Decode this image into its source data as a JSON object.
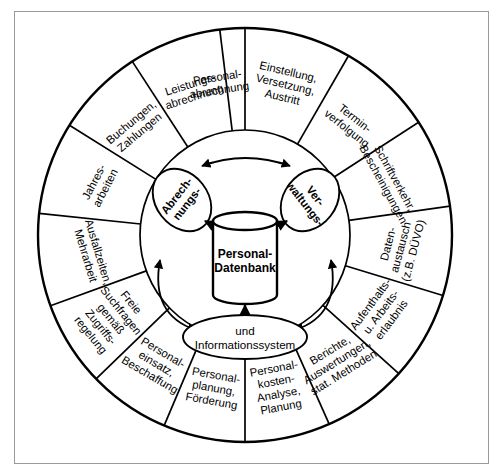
{
  "diagram": {
    "type": "hub-and-spoke-wheel",
    "geometry": {
      "center_x": 245,
      "center_y": 235,
      "outer_radius": 207,
      "inner_radius": 105,
      "top_divider_angle_deg": -90
    },
    "core": {
      "database_label_line1": "Personal-",
      "database_label_line2": "Datenbank",
      "left_lobe_line1": "Abrech-",
      "left_lobe_line2": "nungs-",
      "right_lobe_line1": "Ver-",
      "right_lobe_line2": "waltungs-",
      "bottom_ellipse_line1": "und",
      "bottom_ellipse_line2": "Informationssystem"
    },
    "segments": [
      {
        "id": "einstellung-versetzung-austritt",
        "lines": [
          "Einstellung,",
          "Versetzung,",
          "Austritt"
        ],
        "start_deg": -90,
        "end_deg": -60
      },
      {
        "id": "termin-verfolgung",
        "lines": [
          "Termin-",
          "verfolgung"
        ],
        "start_deg": -60,
        "end_deg": -33
      },
      {
        "id": "schriftverkehr-bescheinigungen",
        "lines": [
          "Schriftverkehr,",
          "Bescheinigungen"
        ],
        "start_deg": -33,
        "end_deg": -8
      },
      {
        "id": "datenaustausch-duevo",
        "lines": [
          "Daten-",
          "austausch",
          "(z.B. DÜVO)"
        ],
        "start_deg": -8,
        "end_deg": 17
      },
      {
        "id": "aufenthalts-arbeitserlaubnis",
        "lines": [
          "Aufenthalts-",
          "u. Arbeits-",
          "erlaubnis"
        ],
        "start_deg": 17,
        "end_deg": 42
      },
      {
        "id": "berichte-auswertungen",
        "lines": [
          "Berichte,",
          "Auswertungen,",
          "stat. Methoden"
        ],
        "start_deg": 42,
        "end_deg": 66
      },
      {
        "id": "personalkosten-analyse-planung",
        "lines": [
          "Personal-",
          "kosten-",
          "Analyse,",
          "Planung"
        ],
        "start_deg": 66,
        "end_deg": 90
      },
      {
        "id": "personalplanung-foerderung",
        "lines": [
          "Personal-",
          "planung,",
          "Förderung"
        ],
        "start_deg": 90,
        "end_deg": 113
      },
      {
        "id": "personaleinsatz-beschaffung",
        "lines": [
          "Personal-",
          "einsatz,",
          "Beschaffung"
        ],
        "start_deg": 113,
        "end_deg": 136
      },
      {
        "id": "freie-suchfragen-zugriffsregelung",
        "lines": [
          "Freie",
          "Suchfragen",
          "gemäß",
          "Zugriffs-",
          "regelung"
        ],
        "start_deg": 136,
        "end_deg": 160
      },
      {
        "id": "ausfallzeiten-mehrarbeit",
        "lines": [
          "Ausfallzeiten,",
          "Mehrarbeit"
        ],
        "start_deg": 160,
        "end_deg": 186
      },
      {
        "id": "jahresarbeiten",
        "lines": [
          "Jahres-",
          "arbeiten"
        ],
        "start_deg": 186,
        "end_deg": 212
      },
      {
        "id": "buchungen-zahlungen",
        "lines": [
          "Buchungen,",
          "Zahlungen"
        ],
        "start_deg": 212,
        "end_deg": 237
      },
      {
        "id": "leistungsabrechnung",
        "lines": [
          "Leistungs-",
          "abrechnung"
        ],
        "start_deg": 237,
        "end_deg": 263
      },
      {
        "id": "personalabrechnung",
        "lines": [
          "Personal-",
          "abrechnung"
        ],
        "start_deg": 263,
        "end_deg": 270
      }
    ],
    "colors": {
      "stroke": "#000000",
      "background": "#ffffff",
      "frame_border": "#9a9a9a"
    }
  }
}
